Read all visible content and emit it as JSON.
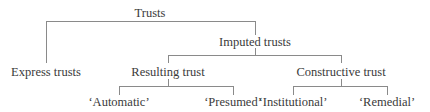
{
  "diagram": {
    "type": "tree",
    "line_color": "#8a8a8a",
    "text_color": "#3a3a3a",
    "nodes": {
      "root": {
        "label": "Trusts",
        "x": 150,
        "y": 13
      },
      "express": {
        "label": "Express trusts",
        "x": 46,
        "y": 72
      },
      "imputed": {
        "label": "Imputed trusts",
        "x": 255,
        "y": 42
      },
      "resulting": {
        "label": "Resulting trust",
        "x": 168,
        "y": 72
      },
      "constructive": {
        "label": "Constructive trust",
        "x": 341,
        "y": 72
      },
      "automatic": {
        "label": "‘Automatic’",
        "x": 119,
        "y": 102
      },
      "presumed": {
        "label": "‘Presumed’",
        "x": 233,
        "y": 102
      },
      "institutional": {
        "label": "‘Institutional’",
        "x": 293,
        "y": 102
      },
      "remedial": {
        "label": "‘Remedial’",
        "x": 387,
        "y": 102
      }
    },
    "edges": [
      [
        "root",
        "express"
      ],
      [
        "root",
        "imputed"
      ],
      [
        "imputed",
        "resulting"
      ],
      [
        "imputed",
        "constructive"
      ],
      [
        "resulting",
        "automatic"
      ],
      [
        "resulting",
        "presumed"
      ],
      [
        "constructive",
        "institutional"
      ],
      [
        "constructive",
        "remedial"
      ]
    ]
  }
}
